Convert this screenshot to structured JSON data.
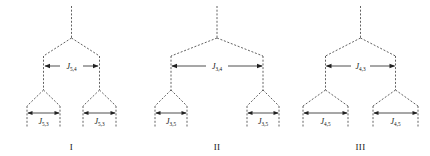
{
  "figure": {
    "type": "nmr-splitting-tree-diagram",
    "background_color": "#ffffff",
    "line_color": "#3a3a3a",
    "text_color": "#111111",
    "panel_count": 3
  },
  "panels": [
    {
      "id": "panel-1",
      "roman_numeral": "I",
      "top_coupling": {
        "symbol": "J",
        "subscript": "5,4"
      },
      "bottom_couplings": [
        {
          "symbol": "J",
          "subscript": "5,3",
          "position": "left"
        },
        {
          "symbol": "J",
          "subscript": "5,3",
          "position": "right"
        }
      ],
      "top_span_px": 56,
      "bottom_span_px": 30
    },
    {
      "id": "panel-2",
      "roman_numeral": "II",
      "top_coupling": {
        "symbol": "J",
        "subscript": "3,4"
      },
      "bottom_couplings": [
        {
          "symbol": "J",
          "subscript": "3,5",
          "position": "left"
        },
        {
          "symbol": "J",
          "subscript": "3,5",
          "position": "right"
        }
      ],
      "top_span_px": 92,
      "bottom_span_px": 30
    },
    {
      "id": "panel-3",
      "roman_numeral": "III",
      "top_coupling": {
        "symbol": "J",
        "subscript": "4,3"
      },
      "bottom_couplings": [
        {
          "symbol": "J",
          "subscript": "4,5",
          "position": "left"
        },
        {
          "symbol": "J",
          "subscript": "4,5",
          "position": "right"
        }
      ],
      "top_span_px": 70,
      "bottom_span_px": 44
    }
  ]
}
